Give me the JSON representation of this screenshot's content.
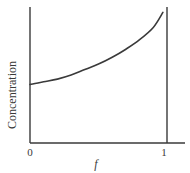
{
  "chart_data": {
    "type": "line",
    "title": "",
    "xlabel": "f",
    "ylabel": "Concentration",
    "xlim": [
      0,
      1
    ],
    "ylim": [
      0,
      1
    ],
    "x_ticks": [
      "0",
      "1"
    ],
    "y_ticks": [],
    "grid": false,
    "legend": null,
    "series": [
      {
        "name": "concentration",
        "x": [
          0.0,
          0.1,
          0.2,
          0.3,
          0.4,
          0.5,
          0.6,
          0.7,
          0.8,
          0.9,
          0.97
        ],
        "values": [
          0.43,
          0.45,
          0.47,
          0.5,
          0.54,
          0.58,
          0.63,
          0.69,
          0.76,
          0.85,
          0.96
        ]
      }
    ],
    "annotations": [
      {
        "type": "vertical_line",
        "x": 1,
        "description": "vertical boundary line at f = 1"
      }
    ]
  },
  "labels": {
    "y_axis": "Concentration",
    "x_axis": "f",
    "x_tick_0": "0",
    "x_tick_1": "1"
  },
  "colors": {
    "line": "#3a3a3a",
    "axis": "#3a3a3a",
    "background": "#ffffff"
  }
}
